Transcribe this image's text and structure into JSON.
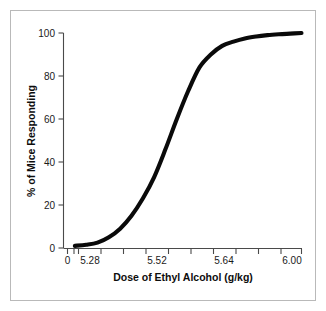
{
  "figure": {
    "background_color": "#ffffff",
    "frame_color": "#b9b9b9",
    "curve_color": "#0a0a0a",
    "axis_color": "#4a4a4a"
  },
  "chart_data": {
    "type": "line",
    "title": "",
    "subtitle": "",
    "xlabel": "Dose of Ethyl Alcohol (g/kg)",
    "ylabel": "% of Mice Responding",
    "xlim": [
      5.16,
      6.0
    ],
    "ylim": [
      0,
      100
    ],
    "grid": false,
    "legend": "none",
    "x_tick_labels": [
      "0",
      "5.28",
      "5.52",
      "5.64",
      "6.00"
    ],
    "x_tick_values": [
      0,
      5.28,
      5.52,
      5.64,
      6.0
    ],
    "y_tick_labels": [
      "0",
      "20",
      "40",
      "60",
      "80",
      "100"
    ],
    "y_tick_values": [
      0,
      20,
      40,
      60,
      80,
      100
    ],
    "axis_break_after_origin": true,
    "annotations": [],
    "series": [
      {
        "name": "% of Mice Responding",
        "x": [
          5.2,
          5.24,
          5.28,
          5.32,
          5.36,
          5.4,
          5.44,
          5.48,
          5.52,
          5.56,
          5.6,
          5.64,
          5.68,
          5.72,
          5.76,
          5.8,
          5.84,
          5.88,
          5.92,
          5.96,
          6.0
        ],
        "values": [
          1,
          1.5,
          2.5,
          5,
          9,
          15,
          23,
          33,
          46,
          60,
          73,
          84,
          90,
          94,
          96,
          97.5,
          98.4,
          99,
          99.4,
          99.7,
          100
        ]
      }
    ]
  }
}
